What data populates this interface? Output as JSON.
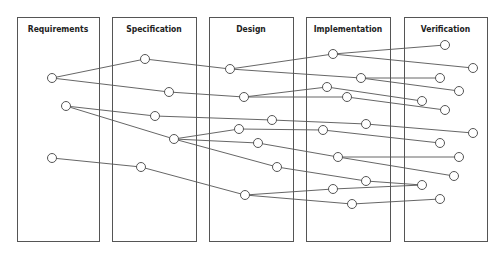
{
  "diagram": {
    "type": "traceability-flow",
    "phases": [
      {
        "id": "R",
        "label": "Requirements",
        "x": 17,
        "y": 17,
        "w": 82,
        "h": 224
      },
      {
        "id": "S",
        "label": "Specification",
        "x": 112,
        "y": 17,
        "w": 84,
        "h": 224
      },
      {
        "id": "D",
        "label": "Design",
        "x": 209,
        "y": 17,
        "w": 84,
        "h": 224
      },
      {
        "id": "I",
        "label": "Implementation",
        "x": 306,
        "y": 17,
        "w": 84,
        "h": 224
      },
      {
        "id": "V",
        "label": "Verification",
        "x": 404,
        "y": 17,
        "w": 83,
        "h": 224
      }
    ],
    "nodes": [
      {
        "id": "R1",
        "x": 52,
        "y": 78
      },
      {
        "id": "R2",
        "x": 66,
        "y": 106
      },
      {
        "id": "R3",
        "x": 52,
        "y": 158
      },
      {
        "id": "S1",
        "x": 145,
        "y": 59
      },
      {
        "id": "S2",
        "x": 169,
        "y": 92
      },
      {
        "id": "S3",
        "x": 155,
        "y": 116
      },
      {
        "id": "S4",
        "x": 174,
        "y": 139
      },
      {
        "id": "S5",
        "x": 141,
        "y": 167
      },
      {
        "id": "D1",
        "x": 230,
        "y": 69
      },
      {
        "id": "D2",
        "x": 244,
        "y": 97
      },
      {
        "id": "D3",
        "x": 272,
        "y": 120
      },
      {
        "id": "D4",
        "x": 239,
        "y": 129
      },
      {
        "id": "D5",
        "x": 258,
        "y": 143
      },
      {
        "id": "D6",
        "x": 277,
        "y": 167
      },
      {
        "id": "D7",
        "x": 245,
        "y": 195
      },
      {
        "id": "I1",
        "x": 333,
        "y": 54
      },
      {
        "id": "I2",
        "x": 361,
        "y": 78
      },
      {
        "id": "I3",
        "x": 327,
        "y": 87
      },
      {
        "id": "I4",
        "x": 347,
        "y": 97
      },
      {
        "id": "I5",
        "x": 366,
        "y": 124
      },
      {
        "id": "I6",
        "x": 323,
        "y": 130
      },
      {
        "id": "I7",
        "x": 338,
        "y": 157
      },
      {
        "id": "I8",
        "x": 366,
        "y": 181
      },
      {
        "id": "I9",
        "x": 333,
        "y": 189
      },
      {
        "id": "I10",
        "x": 352,
        "y": 204
      },
      {
        "id": "V1",
        "x": 445,
        "y": 45
      },
      {
        "id": "V2",
        "x": 473,
        "y": 68
      },
      {
        "id": "V3",
        "x": 440,
        "y": 78
      },
      {
        "id": "V4",
        "x": 459,
        "y": 91
      },
      {
        "id": "V5",
        "x": 422,
        "y": 101
      },
      {
        "id": "V6",
        "x": 445,
        "y": 110
      },
      {
        "id": "V7",
        "x": 473,
        "y": 133
      },
      {
        "id": "V8",
        "x": 440,
        "y": 143
      },
      {
        "id": "V9",
        "x": 459,
        "y": 157
      },
      {
        "id": "V10",
        "x": 454,
        "y": 176
      },
      {
        "id": "V11",
        "x": 422,
        "y": 185
      },
      {
        "id": "V12",
        "x": 440,
        "y": 199
      }
    ],
    "edges": [
      [
        "R1",
        "S1"
      ],
      [
        "R1",
        "S2"
      ],
      [
        "R2",
        "S3"
      ],
      [
        "R2",
        "S4"
      ],
      [
        "R3",
        "S5"
      ],
      [
        "S1",
        "D1"
      ],
      [
        "S2",
        "D2"
      ],
      [
        "S3",
        "D3"
      ],
      [
        "S4",
        "D4"
      ],
      [
        "S4",
        "D5"
      ],
      [
        "S4",
        "D6"
      ],
      [
        "S5",
        "D7"
      ],
      [
        "D1",
        "I1"
      ],
      [
        "D1",
        "I2"
      ],
      [
        "D2",
        "I3"
      ],
      [
        "D2",
        "I4"
      ],
      [
        "D3",
        "I5"
      ],
      [
        "D4",
        "I6"
      ],
      [
        "D5",
        "I7"
      ],
      [
        "D6",
        "I8"
      ],
      [
        "D7",
        "I9"
      ],
      [
        "D7",
        "I10"
      ],
      [
        "I1",
        "V1"
      ],
      [
        "I1",
        "V2"
      ],
      [
        "I2",
        "V3"
      ],
      [
        "I2",
        "V4"
      ],
      [
        "I3",
        "V5"
      ],
      [
        "I4",
        "V6"
      ],
      [
        "I5",
        "V7"
      ],
      [
        "I6",
        "V8"
      ],
      [
        "I7",
        "V9"
      ],
      [
        "I7",
        "V10"
      ],
      [
        "I8",
        "V11"
      ],
      [
        "I9",
        "V11"
      ],
      [
        "I10",
        "V12"
      ]
    ],
    "node_radius": 4.5,
    "colors": {
      "stroke": "#555555",
      "label": "#222222",
      "background": "#ffffff"
    }
  }
}
